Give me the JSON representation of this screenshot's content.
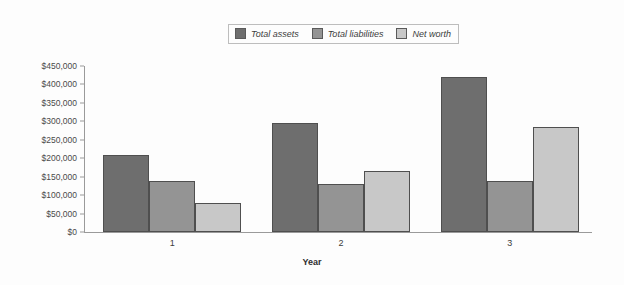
{
  "chart_data": {
    "type": "bar",
    "title": "",
    "subtitle": "",
    "xlabel": "Year",
    "ylabel": "",
    "categories": [
      "1",
      "2",
      "3"
    ],
    "series": [
      {
        "name": "Total assets",
        "color": "#6e6e6e",
        "values": [
          210000,
          295000,
          420000
        ]
      },
      {
        "name": "Total liabilities",
        "color": "#949494",
        "values": [
          138000,
          130000,
          137000
        ]
      },
      {
        "name": "Net worth",
        "color": "#c8c8c8",
        "values": [
          80000,
          165000,
          285000
        ]
      }
    ],
    "ylim": [
      0,
      450000
    ],
    "ytick_step": 50000,
    "ytick_labels": [
      "$450,000",
      "$400,000",
      "$350,000",
      "$300,000",
      "$250,000",
      "$200,000",
      "$150,000",
      "$100,000",
      "$50,000",
      "$0"
    ],
    "ytick_values": [
      450000,
      400000,
      350000,
      300000,
      250000,
      200000,
      150000,
      100000,
      50000,
      0
    ],
    "grid": false,
    "legend_position": "top-center",
    "background_color": "#fdfdfd",
    "axis_color": "#9a9a9a",
    "bar_border_color": "#4f4f4f"
  },
  "legend": {
    "items": [
      {
        "label": "Total assets"
      },
      {
        "label": "Total liabilities"
      },
      {
        "label": "Net worth"
      }
    ]
  }
}
